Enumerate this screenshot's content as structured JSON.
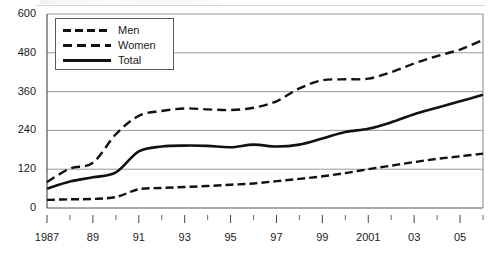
{
  "chart_data": {
    "type": "line",
    "title": "",
    "xlabel": "",
    "ylabel": "",
    "ylim": [
      0,
      600
    ],
    "yticks": [
      0,
      120,
      240,
      360,
      480,
      600
    ],
    "ytick_labels": [
      "0",
      "120",
      "240",
      "360",
      "480",
      "600"
    ],
    "grid": true,
    "legend_position": "top-left",
    "x": [
      1987,
      1988,
      1989,
      1990,
      1991,
      1992,
      1993,
      1994,
      1995,
      1996,
      1997,
      1998,
      1999,
      2000,
      2001,
      2002,
      2003,
      2004,
      2005,
      2006
    ],
    "xtick_labels": [
      "1987",
      "",
      "89",
      "",
      "91",
      "",
      "93",
      "",
      "95",
      "",
      "97",
      "",
      "99",
      "",
      "2001",
      "",
      "03",
      "",
      "05",
      ""
    ],
    "xtick_major": [
      1987,
      1989,
      1991,
      1993,
      1995,
      1997,
      1999,
      2001,
      2003,
      2005
    ],
    "series": [
      {
        "name": "Men",
        "style": "dashed",
        "color": "#111111",
        "values": [
          25,
          27,
          28,
          34,
          58,
          62,
          65,
          68,
          72,
          76,
          83,
          90,
          98,
          108,
          120,
          131,
          142,
          152,
          160,
          168
        ]
      },
      {
        "name": "Women",
        "style": "dashed",
        "color": "#111111",
        "values": [
          80,
          122,
          140,
          228,
          285,
          300,
          308,
          305,
          303,
          310,
          330,
          370,
          395,
          398,
          400,
          420,
          447,
          470,
          490,
          520
        ]
      },
      {
        "name": "Total",
        "style": "solid",
        "color": "#111111",
        "values": [
          60,
          82,
          95,
          110,
          175,
          190,
          193,
          192,
          188,
          196,
          190,
          196,
          215,
          235,
          245,
          265,
          290,
          310,
          330,
          350
        ]
      }
    ]
  },
  "legend": {
    "items": [
      {
        "label": "Men",
        "style": "dashed-short"
      },
      {
        "label": "Women",
        "style": "dashed-long"
      },
      {
        "label": "Total",
        "style": "solid"
      }
    ]
  }
}
